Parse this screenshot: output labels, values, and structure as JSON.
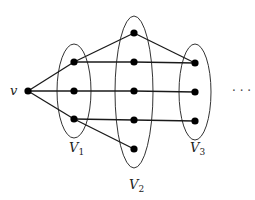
{
  "diagram": {
    "title": "",
    "colors": {
      "edge": "#1a1a1a",
      "node": "#000000",
      "ellipse": "#333333",
      "background": "#ffffff"
    },
    "source_vertex": {
      "id": "v",
      "label": "v",
      "x": 28,
      "y": 91
    },
    "partitions": [
      {
        "id": "V1",
        "label": "V",
        "subscript": "1",
        "cx": 74,
        "cy": 91,
        "rx": 17,
        "ry": 47,
        "label_x": 74,
        "label_y": 152,
        "nodes": [
          {
            "x": 74,
            "y": 62
          },
          {
            "x": 74,
            "y": 91
          },
          {
            "x": 74,
            "y": 119
          }
        ]
      },
      {
        "id": "V2",
        "label": "V",
        "subscript": "2",
        "cx": 134,
        "cy": 92,
        "rx": 19,
        "ry": 76,
        "label_x": 134,
        "label_y": 189,
        "nodes": [
          {
            "x": 134,
            "y": 33
          },
          {
            "x": 134,
            "y": 62
          },
          {
            "x": 134,
            "y": 91
          },
          {
            "x": 134,
            "y": 120
          },
          {
            "x": 134,
            "y": 149
          }
        ]
      },
      {
        "id": "V3",
        "label": "V",
        "subscript": "3",
        "cx": 195,
        "cy": 92,
        "rx": 16,
        "ry": 48,
        "label_x": 195,
        "label_y": 152,
        "nodes": [
          {
            "x": 195,
            "y": 63
          },
          {
            "x": 195,
            "y": 92
          },
          {
            "x": 195,
            "y": 121
          }
        ]
      }
    ],
    "edges": [
      {
        "from": "v",
        "to": "V1.0",
        "x1": 28,
        "y1": 91,
        "x2": 74,
        "y2": 62
      },
      {
        "from": "v",
        "to": "V1.1",
        "x1": 28,
        "y1": 91,
        "x2": 74,
        "y2": 91
      },
      {
        "from": "v",
        "to": "V1.2",
        "x1": 28,
        "y1": 91,
        "x2": 74,
        "y2": 119
      },
      {
        "from": "V1.0",
        "to": "V2.0",
        "x1": 74,
        "y1": 62,
        "x2": 134,
        "y2": 33
      },
      {
        "from": "V1.0",
        "to": "V2.1",
        "x1": 74,
        "y1": 62,
        "x2": 134,
        "y2": 62
      },
      {
        "from": "V1.1",
        "to": "V2.2",
        "x1": 74,
        "y1": 91,
        "x2": 134,
        "y2": 91
      },
      {
        "from": "V1.2",
        "to": "V2.3",
        "x1": 74,
        "y1": 119,
        "x2": 134,
        "y2": 120
      },
      {
        "from": "V1.2",
        "to": "V2.4",
        "x1": 74,
        "y1": 119,
        "x2": 134,
        "y2": 149
      },
      {
        "from": "V2.0",
        "to": "V3.0",
        "x1": 134,
        "y1": 33,
        "x2": 195,
        "y2": 63
      },
      {
        "from": "V2.1",
        "to": "V3.0",
        "x1": 134,
        "y1": 62,
        "x2": 195,
        "y2": 63
      },
      {
        "from": "V2.2",
        "to": "V3.1",
        "x1": 134,
        "y1": 91,
        "x2": 195,
        "y2": 92
      },
      {
        "from": "V2.3",
        "to": "V3.2",
        "x1": 134,
        "y1": 120,
        "x2": 195,
        "y2": 121
      }
    ],
    "continuation": {
      "text": "· · ·",
      "x": 240,
      "y": 95
    }
  }
}
